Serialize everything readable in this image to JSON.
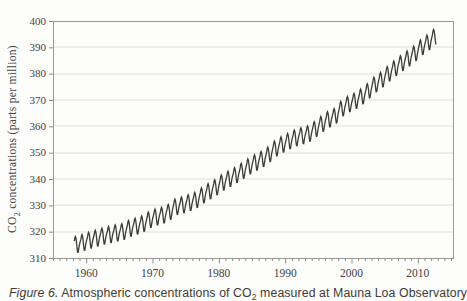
{
  "figure": {
    "caption": {
      "label": "Figure 6.",
      "text_before_sub": " Atmospheric concentrations of CO",
      "sub": "2",
      "text_after_sub": " measured at Mauna Loa Observatory"
    }
  },
  "chart_data": {
    "type": "line",
    "title": "",
    "xlabel": "",
    "ylabel_parts": {
      "prefix": "CO",
      "sub": "2",
      "rest": " concentrations (parts per million)"
    },
    "xlim": [
      1955,
      2015.3
    ],
    "ylim": [
      310,
      400
    ],
    "y_ticks": [
      310,
      320,
      330,
      340,
      350,
      360,
      370,
      380,
      390,
      400
    ],
    "y_tick_labels": [
      "310",
      "320",
      "330",
      "340",
      "350",
      "360",
      "370",
      "380",
      "390",
      "400"
    ],
    "x_major_ticks": [
      1960,
      1970,
      1980,
      1990,
      2000,
      2010
    ],
    "x_tick_labels": [
      "1960",
      "1970",
      "1980",
      "1990",
      "2000",
      "2010"
    ],
    "x_minor_tick_interval": 1,
    "grid": "horizontal",
    "legend": "none",
    "series": [
      {
        "name": "Monthly mean CO2 concentration, Mauna Loa Observatory",
        "units": "ppm",
        "start_year": 1958,
        "data_start": 1958.2,
        "data_end": 2012.8,
        "annual_means": [
          315.23,
          315.97,
          316.91,
          317.64,
          318.45,
          318.99,
          319.62,
          320.04,
          321.37,
          322.18,
          323.05,
          324.62,
          325.68,
          326.32,
          327.46,
          329.68,
          330.19,
          331.12,
          332.03,
          333.84,
          335.41,
          336.84,
          338.76,
          340.12,
          341.48,
          343.15,
          344.85,
          346.35,
          347.61,
          349.31,
          351.69,
          353.2,
          354.45,
          355.7,
          356.54,
          357.21,
          358.96,
          360.97,
          362.74,
          363.88,
          366.84,
          368.54,
          369.71,
          371.32,
          373.45,
          375.98,
          377.7,
          379.98,
          382.09,
          384.02,
          385.83,
          387.64,
          390.1,
          391.85,
          394.06
        ],
        "seasonal_offsets_by_month": [
          0.0,
          0.7,
          1.4,
          2.6,
          3.0,
          2.3,
          0.7,
          -1.6,
          -3.2,
          -3.3,
          -2.1,
          -0.9
        ]
      }
    ],
    "colors": {
      "line": "#3a3a3a",
      "grid": "#e0ded9",
      "frame": "#9a9894",
      "tick": "#8f8d89",
      "label": "#45403c"
    }
  }
}
